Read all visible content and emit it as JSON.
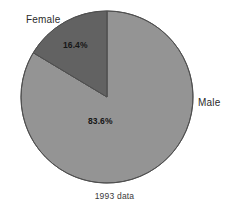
{
  "chart_data": {
    "type": "pie",
    "title": "",
    "subtitle": "",
    "caption": "1993 data",
    "xlabel": "",
    "ylabel": "",
    "legend_position": "none",
    "grid": false,
    "start_angle_deg": 90,
    "direction": "counterclockwise",
    "center": {
      "x": 107,
      "y": 97
    },
    "radius": 86,
    "categories": [
      "Male",
      "Female"
    ],
    "values": [
      83.6,
      16.4
    ],
    "value_labels": [
      "83.6%",
      "16.4%"
    ],
    "units": "percent",
    "slices": [
      {
        "label": "Male",
        "value": 83.6,
        "value_label": "83.6%",
        "color": "#949494",
        "stroke": "#555555",
        "label_position": "outside-right"
      },
      {
        "label": "Female",
        "value": 16.4,
        "value_label": "16.4%",
        "color": "#626262",
        "stroke": "#555555",
        "label_position": "outside-top-left"
      }
    ]
  },
  "labels": {
    "female": "Female",
    "male": "Male"
  },
  "values": {
    "female_pct": "16.4%",
    "male_pct": "83.6%"
  },
  "caption": "1993 data",
  "colors": {
    "background": "#ffffff",
    "slice_male": "#949494",
    "slice_female": "#626262",
    "outline": "#555555",
    "text": "#2b2b2b"
  }
}
